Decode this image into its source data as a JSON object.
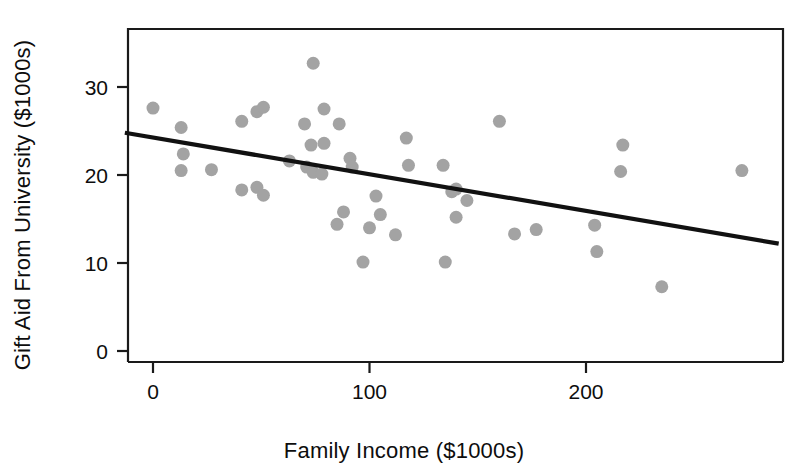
{
  "chart_data": {
    "type": "scatter",
    "title": "",
    "xlabel": "Family Income ($1000s)",
    "ylabel": "Gift Aid From University ($1000s)",
    "xlim": [
      -13,
      290
    ],
    "ylim": [
      -2,
      36
    ],
    "xticks": [
      0,
      100,
      200
    ],
    "xticklabels": [
      "0",
      "100",
      "200"
    ],
    "yticks": [
      0,
      10,
      20,
      30
    ],
    "yticklabels": [
      "0",
      "10",
      "20",
      "30"
    ],
    "grid": false,
    "legend": null,
    "marker": {
      "shape": "circle",
      "color": "#a3a3a3",
      "size": 13
    },
    "trendline": {
      "type": "linear",
      "color": "#111111",
      "x_start": -13,
      "y_start": 24.8,
      "x_end": 289,
      "y_end": 12.2
    },
    "points": [
      {
        "x": 0,
        "y": 27.6
      },
      {
        "x": 13,
        "y": 25.4
      },
      {
        "x": 14,
        "y": 22.4
      },
      {
        "x": 13,
        "y": 20.5
      },
      {
        "x": 27,
        "y": 20.6
      },
      {
        "x": 41,
        "y": 26.1
      },
      {
        "x": 41,
        "y": 18.3
      },
      {
        "x": 48,
        "y": 27.2
      },
      {
        "x": 51,
        "y": 27.7
      },
      {
        "x": 48,
        "y": 18.6
      },
      {
        "x": 51,
        "y": 17.7
      },
      {
        "x": 63,
        "y": 21.6
      },
      {
        "x": 70,
        "y": 25.8
      },
      {
        "x": 74,
        "y": 32.7
      },
      {
        "x": 73,
        "y": 23.4
      },
      {
        "x": 71,
        "y": 20.9
      },
      {
        "x": 74,
        "y": 20.3
      },
      {
        "x": 79,
        "y": 27.5
      },
      {
        "x": 79,
        "y": 23.6
      },
      {
        "x": 78,
        "y": 20.1
      },
      {
        "x": 86,
        "y": 25.8
      },
      {
        "x": 88,
        "y": 15.8
      },
      {
        "x": 85,
        "y": 14.4
      },
      {
        "x": 91,
        "y": 21.9
      },
      {
        "x": 92,
        "y": 20.9
      },
      {
        "x": 97,
        "y": 10.1
      },
      {
        "x": 100,
        "y": 14.0
      },
      {
        "x": 103,
        "y": 17.6
      },
      {
        "x": 105,
        "y": 15.5
      },
      {
        "x": 112,
        "y": 13.2
      },
      {
        "x": 117,
        "y": 24.2
      },
      {
        "x": 118,
        "y": 21.1
      },
      {
        "x": 134,
        "y": 21.1
      },
      {
        "x": 135,
        "y": 10.1
      },
      {
        "x": 138,
        "y": 18.1
      },
      {
        "x": 140,
        "y": 18.4
      },
      {
        "x": 140,
        "y": 15.2
      },
      {
        "x": 145,
        "y": 17.1
      },
      {
        "x": 160,
        "y": 26.1
      },
      {
        "x": 167,
        "y": 13.3
      },
      {
        "x": 177,
        "y": 13.8
      },
      {
        "x": 204,
        "y": 14.3
      },
      {
        "x": 205,
        "y": 11.3
      },
      {
        "x": 217,
        "y": 23.4
      },
      {
        "x": 216,
        "y": 20.4
      },
      {
        "x": 235,
        "y": 7.3
      },
      {
        "x": 272,
        "y": 20.5
      }
    ]
  }
}
